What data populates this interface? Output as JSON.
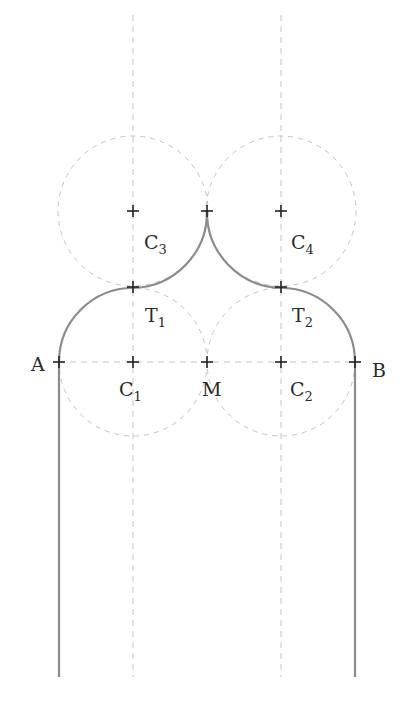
{
  "diagram": {
    "title": "",
    "colors": {
      "outline": "#8c8c8c",
      "construction": "#c4c4c4",
      "marker": "#222222",
      "label": "#2a2a2a",
      "background": "#ffffff"
    },
    "radius": 74,
    "points": {
      "A": {
        "label": "A",
        "x": 59,
        "y": 362
      },
      "B": {
        "label": "B",
        "x": 355,
        "y": 362
      },
      "M": {
        "label": "M",
        "x": 207,
        "y": 362
      },
      "C1": {
        "label": "C",
        "sub": "1",
        "x": 133,
        "y": 362
      },
      "C2": {
        "label": "C",
        "sub": "2",
        "x": 281,
        "y": 362
      },
      "C3": {
        "label": "C",
        "sub": "3",
        "x": 133,
        "y": 211
      },
      "C4": {
        "label": "C",
        "sub": "4",
        "x": 281,
        "y": 211
      },
      "T1": {
        "label": "T",
        "sub": "1",
        "x": 133,
        "y": 287
      },
      "T2": {
        "label": "T",
        "sub": "2",
        "x": 281,
        "y": 287
      },
      "apex": {
        "label": "",
        "x": 207,
        "y": 211
      }
    },
    "labels": {
      "A": "A",
      "B": "B",
      "M": "M",
      "C": "C",
      "T": "T",
      "sub1": "1",
      "sub2": "2",
      "sub3": "3",
      "sub4": "4"
    }
  }
}
